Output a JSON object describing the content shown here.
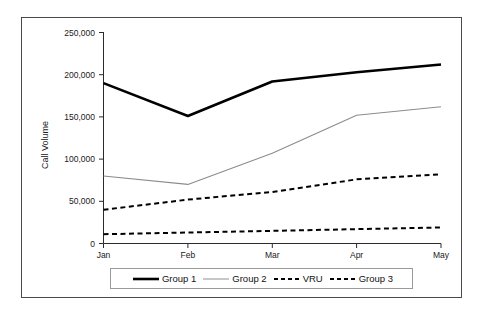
{
  "chart_data": {
    "type": "line",
    "title": "",
    "xlabel": "",
    "ylabel": "Call Volume",
    "categories": [
      "Jan",
      "Feb",
      "Mar",
      "Apr",
      "May"
    ],
    "ylim": [
      0,
      250000
    ],
    "yticks": [
      0,
      50000,
      100000,
      150000,
      200000,
      250000
    ],
    "ytick_labels": [
      "0",
      "50,000",
      "100,000",
      "150,000",
      "200,000",
      "250,000"
    ],
    "grid": false,
    "legend_position": "bottom",
    "series": [
      {
        "name": "Group 1",
        "values": [
          190000,
          151000,
          192000,
          203000,
          212000
        ],
        "color": "#000000",
        "style": "solid",
        "width": 2.6
      },
      {
        "name": "Group 2",
        "values": [
          80000,
          70000,
          107000,
          152000,
          162000
        ],
        "color": "#8c8c8c",
        "style": "solid",
        "width": 1.1
      },
      {
        "name": "VRU",
        "values": [
          40000,
          52000,
          61000,
          76000,
          82000
        ],
        "color": "#000000",
        "style": "dashed",
        "width": 2.0
      },
      {
        "name": "Group 3",
        "values": [
          11000,
          13000,
          15000,
          17000,
          19000
        ],
        "color": "#000000",
        "style": "dashed",
        "width": 2.0
      }
    ]
  },
  "legend": {
    "entries": [
      {
        "label": "Group 1",
        "swatch": "thick-solid-black-line-icon"
      },
      {
        "label": "Group 2",
        "swatch": "thin-solid-gray-line-icon"
      },
      {
        "label": "VRU",
        "swatch": "dashed-black-line-icon"
      },
      {
        "label": "Group 3",
        "swatch": "dashed-black-line-icon"
      }
    ]
  }
}
